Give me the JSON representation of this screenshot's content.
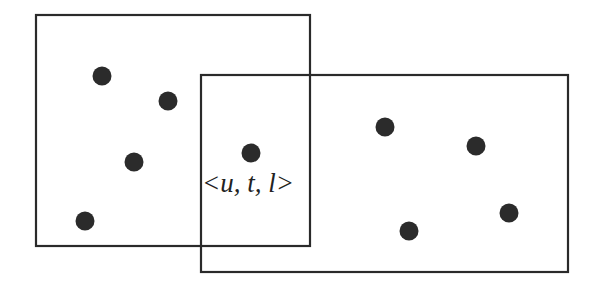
{
  "diagram": {
    "label": "<u, t, l>",
    "colors": {
      "stroke": "#2a2a2a",
      "dot": "#2b2b2b",
      "background": "#ffffff"
    },
    "rectangles": [
      {
        "id": "left-region",
        "x": 36,
        "y": 15,
        "width": 274,
        "height": 231
      },
      {
        "id": "right-region",
        "x": 201,
        "y": 75,
        "width": 367,
        "height": 197
      }
    ],
    "points": [
      {
        "region": "left",
        "x": 102,
        "y": 76
      },
      {
        "region": "left",
        "x": 168,
        "y": 101
      },
      {
        "region": "left",
        "x": 134,
        "y": 162
      },
      {
        "region": "left",
        "x": 85,
        "y": 221
      },
      {
        "region": "overlap",
        "x": 251,
        "y": 153
      },
      {
        "region": "right",
        "x": 385,
        "y": 127
      },
      {
        "region": "right",
        "x": 476,
        "y": 146
      },
      {
        "region": "right",
        "x": 509,
        "y": 213
      },
      {
        "region": "right",
        "x": 409,
        "y": 231
      }
    ]
  }
}
